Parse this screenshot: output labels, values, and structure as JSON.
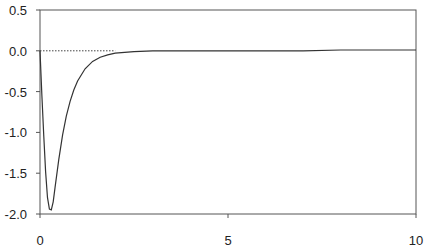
{
  "chart_data": {
    "type": "line",
    "title": "",
    "xlabel": "",
    "ylabel": "",
    "xlim": [
      0,
      10
    ],
    "ylim": [
      -2.0,
      0.5
    ],
    "x_ticks": [
      0,
      5,
      10
    ],
    "x_tick_labels": [
      "0",
      "5",
      "10"
    ],
    "y_ticks": [
      0.5,
      0.0,
      -0.5,
      -1.0,
      -1.5,
      -2.0
    ],
    "y_tick_labels": [
      "0.5",
      "0.0",
      "-0.5",
      "-1.0",
      "-1.5",
      "-2.0"
    ],
    "grid": false,
    "legend": null,
    "reference_line": {
      "y": 0.0,
      "style": "dotted",
      "x_range": [
        0,
        2.0
      ]
    },
    "series": [
      {
        "name": "curve",
        "x": [
          0,
          0.05,
          0.1,
          0.15,
          0.2,
          0.25,
          0.3,
          0.35,
          0.4,
          0.5,
          0.6,
          0.7,
          0.8,
          0.9,
          1.0,
          1.2,
          1.4,
          1.6,
          1.8,
          2.0,
          2.5,
          3.0,
          3.5,
          4.0,
          5.0,
          6.0,
          7.0,
          8.0,
          9.0,
          10.0
        ],
        "values": [
          0.0,
          -0.55,
          -1.05,
          -1.48,
          -1.8,
          -1.94,
          -1.95,
          -1.85,
          -1.68,
          -1.33,
          -1.03,
          -0.8,
          -0.62,
          -0.48,
          -0.37,
          -0.22,
          -0.13,
          -0.08,
          -0.05,
          -0.03,
          -0.01,
          0.0,
          0.0,
          0.0,
          0.0,
          0.0,
          0.0,
          0.01,
          0.01,
          0.01
        ]
      }
    ]
  }
}
